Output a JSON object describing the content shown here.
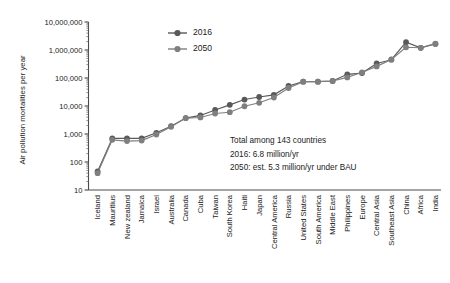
{
  "chart_data": {
    "type": "line",
    "title": "",
    "xlabel": "",
    "ylabel": "Air pollution mortalities per year",
    "yscale": "log",
    "ylim": [
      10,
      10000000
    ],
    "grid": false,
    "legend_position": "upper-center-left",
    "ytick_labels": [
      "10,000,000",
      "1,000,000",
      "100,000",
      "10,000",
      "1,000",
      "100",
      "10"
    ],
    "ytick_values": [
      10000000,
      1000000,
      100000,
      10000,
      1000,
      100,
      10
    ],
    "categories": [
      "Iceland",
      "Mauritius",
      "New zealand",
      "Jamaica",
      "Israel",
      "Australia",
      "Canada",
      "Cuba",
      "Taiwan",
      "South Korea",
      "Haiti",
      "Japan",
      "Central America",
      "Russia",
      "United States",
      "South America",
      "Middle East",
      "Philippines",
      "Europe",
      "Central Asia",
      "Southeast Asia",
      "China",
      "Africa",
      "India"
    ],
    "series": [
      {
        "name": "2016",
        "color": "#595959",
        "values": [
          46,
          700,
          700,
          700,
          1100,
          1900,
          3700,
          4600,
          7200,
          11000,
          17000,
          21000,
          25000,
          52000,
          74000,
          74000,
          78000,
          135000,
          150000,
          330000,
          450000,
          1900000,
          1200000,
          1650000
        ]
      },
      {
        "name": "2050",
        "color": "#7f7f7f",
        "values": [
          40,
          620,
          560,
          580,
          960,
          1800,
          3700,
          3900,
          5400,
          6000,
          9800,
          13000,
          20000,
          44000,
          74000,
          74000,
          78000,
          105000,
          160000,
          260000,
          460000,
          1250000,
          1200000,
          1700000
        ]
      }
    ],
    "annotations": [
      "Total among 143 countries",
      "2016: 6.8 million/yr",
      "2050: est. 5.3 million/yr under BAU"
    ]
  },
  "legend": {
    "entries": [
      {
        "label": "2016"
      },
      {
        "label": "2050"
      }
    ]
  }
}
